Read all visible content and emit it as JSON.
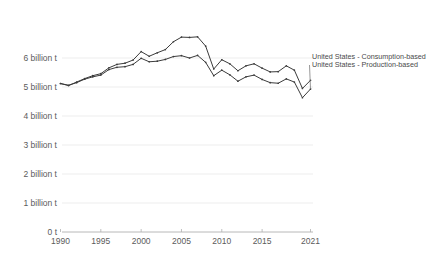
{
  "chart_data": {
    "type": "line",
    "title": "",
    "subtitle": "",
    "xlabel": "",
    "ylabel": "",
    "xlim": [
      1990,
      2021
    ],
    "ylim": [
      0,
      7
    ],
    "grid": true,
    "legend_position": "right-inline",
    "x": [
      1990,
      1991,
      1992,
      1993,
      1994,
      1995,
      1996,
      1997,
      1998,
      1999,
      2000,
      2001,
      2002,
      2003,
      2004,
      2005,
      2006,
      2007,
      2008,
      2009,
      2010,
      2011,
      2012,
      2013,
      2014,
      2015,
      2016,
      2017,
      2018,
      2019,
      2020,
      2021
    ],
    "ytick_labels": [
      "0 t",
      "1 billion t",
      "2 billion t",
      "3 billion t",
      "4 billion t",
      "5 billion t",
      "6 billion t"
    ],
    "ytick_values": [
      0,
      1,
      2,
      3,
      4,
      5,
      6
    ],
    "xtick_labels": [
      "1990",
      "1995",
      "2000",
      "2005",
      "2010",
      "2015",
      "2021"
    ],
    "xtick_values": [
      1990,
      1995,
      2000,
      2005,
      2010,
      2015,
      2021
    ],
    "series": [
      {
        "name": "United States - Consumption-based",
        "values": [
          5.12,
          5.05,
          5.17,
          5.29,
          5.39,
          5.46,
          5.66,
          5.78,
          5.82,
          5.93,
          6.22,
          6.06,
          6.18,
          6.29,
          6.56,
          6.72,
          6.71,
          6.73,
          6.41,
          5.62,
          5.94,
          5.8,
          5.56,
          5.73,
          5.8,
          5.65,
          5.52,
          5.53,
          5.73,
          5.58,
          4.95,
          5.23
        ]
      },
      {
        "name": "United States - Production-based",
        "values": [
          5.12,
          5.06,
          5.15,
          5.27,
          5.35,
          5.41,
          5.6,
          5.68,
          5.7,
          5.78,
          5.99,
          5.87,
          5.89,
          5.95,
          6.05,
          6.08,
          6.0,
          6.09,
          5.85,
          5.39,
          5.58,
          5.42,
          5.2,
          5.35,
          5.41,
          5.26,
          5.15,
          5.13,
          5.28,
          5.17,
          4.63,
          4.93
        ]
      }
    ],
    "colors": {
      "line": "#3b3b3b",
      "grid": "#e8e8e8",
      "axis": "#b0b0b0",
      "tick_text": "#5b5b5b",
      "legend_text": "#4a4a4a",
      "background": "#ffffff"
    },
    "legend_entries": [
      "United States - Consumption-based",
      "United States - Production-based"
    ]
  }
}
